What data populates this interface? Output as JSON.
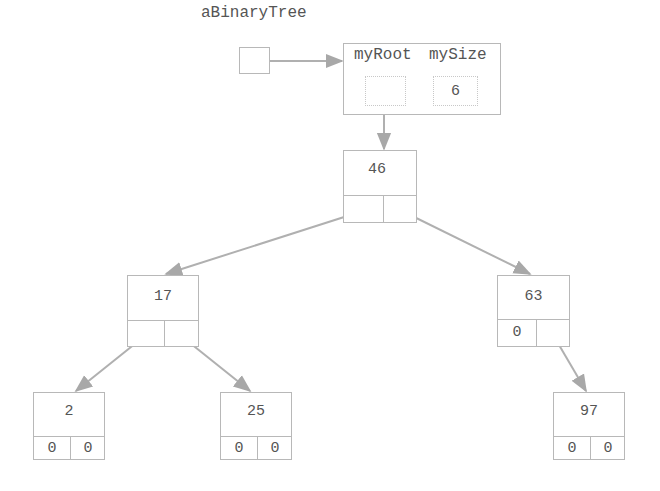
{
  "diagram": {
    "title": "aBinaryTree",
    "variable": {
      "name": "aBinaryTree"
    },
    "tree_object": {
      "fields": [
        "myRoot",
        "mySize"
      ],
      "field_labels": {
        "myRoot": "myRoot",
        "mySize": "mySize"
      },
      "mySize_value": "6"
    },
    "nodes": [
      {
        "id": "n46",
        "value": "46",
        "left": "",
        "right": ""
      },
      {
        "id": "n17",
        "value": "17",
        "left": "",
        "right": ""
      },
      {
        "id": "n63",
        "value": "63",
        "left": "0",
        "right": ""
      },
      {
        "id": "n2",
        "value": "2",
        "left": "0",
        "right": "0"
      },
      {
        "id": "n25",
        "value": "25",
        "left": "0",
        "right": "0"
      },
      {
        "id": "n97",
        "value": "97",
        "left": "0",
        "right": "0"
      }
    ],
    "edges": [
      {
        "from": "aBinaryTree",
        "to": "tree_object"
      },
      {
        "from": "myRoot",
        "to": "46"
      },
      {
        "from": "46",
        "to": "17",
        "side": "left"
      },
      {
        "from": "46",
        "to": "63",
        "side": "right"
      },
      {
        "from": "17",
        "to": "2",
        "side": "left"
      },
      {
        "from": "17",
        "to": "25",
        "side": "right"
      },
      {
        "from": "63",
        "to": "97",
        "side": "right"
      }
    ],
    "colors": {
      "line": "#b0b0b0",
      "arrow": "#a8a8a8",
      "text": "#555555"
    }
  }
}
